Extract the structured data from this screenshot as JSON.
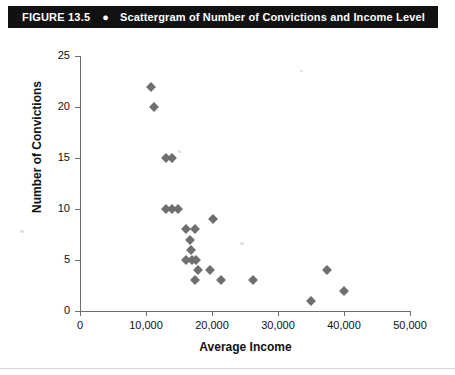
{
  "figure": {
    "number": "FIGURE 13.5",
    "bullet": "bullet-dot",
    "title": "Scattergram of Number of Convictions and Income Level"
  },
  "chart_data": {
    "type": "scatter",
    "title": "Scattergram of Number of Convictions and Income Level",
    "xlabel": "Average Income",
    "ylabel": "Number of Convictions",
    "xlim": [
      0,
      50000
    ],
    "ylim": [
      0,
      25
    ],
    "xticks": [
      0,
      10000,
      20000,
      30000,
      40000,
      50000
    ],
    "xticklabels": [
      "0",
      "10,000",
      "20,000",
      "30,000",
      "40,000",
      "50,000"
    ],
    "yticks": [
      0,
      5,
      10,
      15,
      20,
      25
    ],
    "yticklabels": [
      "0",
      "5",
      "10",
      "15",
      "20",
      "25"
    ],
    "grid": false,
    "legend": null,
    "marker": "diamond",
    "marker_color": "#6f6f6f",
    "points": [
      {
        "x": 10800,
        "y": 22
      },
      {
        "x": 11200,
        "y": 20
      },
      {
        "x": 13000,
        "y": 15
      },
      {
        "x": 14000,
        "y": 15
      },
      {
        "x": 13000,
        "y": 10
      },
      {
        "x": 13900,
        "y": 10
      },
      {
        "x": 14900,
        "y": 10
      },
      {
        "x": 16000,
        "y": 8
      },
      {
        "x": 17400,
        "y": 8
      },
      {
        "x": 20200,
        "y": 9
      },
      {
        "x": 16600,
        "y": 7
      },
      {
        "x": 16800,
        "y": 6
      },
      {
        "x": 16100,
        "y": 5
      },
      {
        "x": 16900,
        "y": 5
      },
      {
        "x": 17600,
        "y": 5
      },
      {
        "x": 17900,
        "y": 4
      },
      {
        "x": 19700,
        "y": 4
      },
      {
        "x": 17400,
        "y": 3
      },
      {
        "x": 21300,
        "y": 3
      },
      {
        "x": 26200,
        "y": 3
      },
      {
        "x": 35000,
        "y": 1
      },
      {
        "x": 37400,
        "y": 4
      },
      {
        "x": 40000,
        "y": 2
      }
    ]
  }
}
